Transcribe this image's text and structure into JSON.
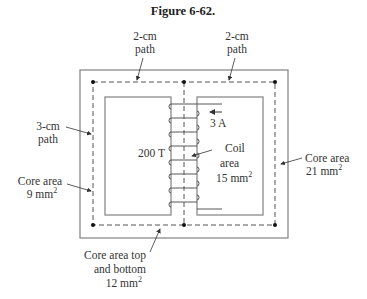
{
  "figure": {
    "title": "Figure 6-62.",
    "colors": {
      "core_outline": "#888888",
      "path_dash": "#555555",
      "text": "#333333",
      "background": "#ffffff"
    }
  },
  "labels": {
    "top_left_path": [
      "2-cm",
      "path"
    ],
    "top_right_path": [
      "2-cm",
      "path"
    ],
    "left_path": [
      "3-cm",
      "path"
    ],
    "left_core_area": [
      "Core area",
      "9 mm",
      "2"
    ],
    "right_core_area": [
      "Core area",
      "21 mm",
      "2"
    ],
    "current": "3 A",
    "turns": "200 T",
    "coil_area": [
      "Coil",
      "area",
      "15 mm",
      "2"
    ],
    "bottom_core_area": [
      "Core area top",
      "and bottom",
      "12 mm",
      "2"
    ]
  }
}
